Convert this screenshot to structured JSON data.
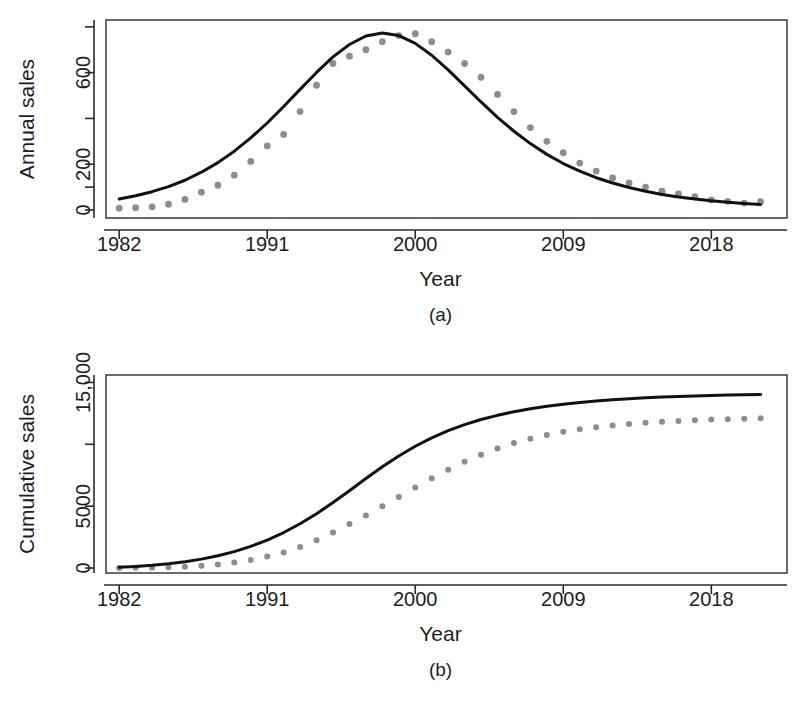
{
  "figure": {
    "background": "#ffffff",
    "ink_color": "#1a1a1a",
    "point_color": "#8d8d8d",
    "line_color": "#111111"
  },
  "panels": [
    {
      "tag": "(a)",
      "xlabel": "Year",
      "ylabel": "Annual sales",
      "x_ticks": [
        "1982",
        "1991",
        "2000",
        "2009",
        "2018"
      ],
      "y_ticks": [
        "0",
        "",
        "200",
        "",
        "600",
        ""
      ]
    },
    {
      "tag": "(b)",
      "xlabel": "Year",
      "ylabel": "Cumulative sales",
      "x_ticks": [
        "1982",
        "1991",
        "2000",
        "2009",
        "2018"
      ],
      "y_ticks": [
        "0",
        "5000",
        "",
        "15,000"
      ]
    }
  ],
  "chart_data": [
    {
      "id": "panel-a",
      "type": "scatter",
      "title": "",
      "subtitle": "(a)",
      "xlabel": "Year",
      "ylabel": "Annual sales",
      "xlim": [
        1981.2,
        2022.6
      ],
      "ylim": [
        -35,
        830
      ],
      "x_tick_values": [
        1982,
        1991,
        2000,
        2009,
        2018
      ],
      "x_tick_labels": [
        "1982",
        "1991",
        "2000",
        "2009",
        "2018"
      ],
      "y_tick_values": [
        0,
        100,
        200,
        400,
        600,
        800
      ],
      "y_tick_labels": [
        "0",
        "",
        "200",
        "",
        "600",
        ""
      ],
      "grid": false,
      "legend": "none",
      "x": [
        1982,
        1983,
        1984,
        1985,
        1986,
        1987,
        1988,
        1989,
        1990,
        1991,
        1992,
        1993,
        1994,
        1995,
        1996,
        1997,
        1998,
        1999,
        2000,
        2001,
        2002,
        2003,
        2004,
        2005,
        2006,
        2007,
        2008,
        2009,
        2010,
        2011,
        2012,
        2013,
        2014,
        2015,
        2016,
        2017,
        2018,
        2019,
        2020,
        2021
      ],
      "series": [
        {
          "name": "Observed annual sales",
          "marker": "filled-circle",
          "color": "#8d8d8d",
          "values": [
            8,
            10,
            14,
            25,
            46,
            78,
            108,
            152,
            212,
            280,
            330,
            430,
            545,
            640,
            672,
            700,
            735,
            762,
            770,
            735,
            690,
            640,
            580,
            505,
            430,
            360,
            300,
            250,
            205,
            170,
            140,
            118,
            100,
            82,
            70,
            58,
            44,
            38,
            30,
            36
          ]
        },
        {
          "name": "Fitted Bass model",
          "marker": "none",
          "line": "solid",
          "color": "#111111",
          "values": [
            48,
            62,
            80,
            102,
            130,
            165,
            207,
            257,
            315,
            380,
            452,
            527,
            601,
            669,
            723,
            760,
            773,
            762,
            728,
            676,
            612,
            542,
            472,
            405,
            344,
            290,
            243,
            203,
            170,
            141,
            118,
            98,
            82,
            68,
            57,
            48,
            40,
            34,
            28,
            24
          ]
        }
      ]
    },
    {
      "id": "panel-b",
      "type": "scatter",
      "title": "",
      "subtitle": "(b)",
      "xlabel": "Year",
      "ylabel": "Cumulative sales",
      "xlim": [
        1981.2,
        2022.6
      ],
      "ylim": [
        -400,
        15600
      ],
      "x_tick_values": [
        1982,
        1991,
        2000,
        2009,
        2018
      ],
      "x_tick_labels": [
        "1982",
        "1991",
        "2000",
        "2009",
        "2018"
      ],
      "y_tick_values": [
        0,
        5000,
        10000,
        15000
      ],
      "y_tick_labels": [
        "0",
        "5000",
        "",
        "15,000"
      ],
      "grid": false,
      "legend": "none",
      "x": [
        1982,
        1983,
        1984,
        1985,
        1986,
        1987,
        1988,
        1989,
        1990,
        1991,
        1992,
        1993,
        1994,
        1995,
        1996,
        1997,
        1998,
        1999,
        2000,
        2001,
        2002,
        2003,
        2004,
        2005,
        2006,
        2007,
        2008,
        2009,
        2010,
        2011,
        2012,
        2013,
        2014,
        2015,
        2016,
        2017,
        2018,
        2019,
        2020,
        2021
      ],
      "series": [
        {
          "name": "Observed cumulative sales",
          "marker": "filled-circle",
          "color": "#8d8d8d",
          "values": [
            8,
            18,
            32,
            57,
            103,
            181,
            289,
            441,
            653,
            933,
            1263,
            1693,
            2238,
            2878,
            3550,
            4250,
            4985,
            5747,
            6517,
            7252,
            7942,
            8582,
            9162,
            9667,
            10097,
            10457,
            10757,
            11007,
            11212,
            11382,
            11522,
            11640,
            11740,
            11822,
            11892,
            11950,
            11994,
            12032,
            12062,
            12098
          ]
        },
        {
          "name": "Fitted cumulative curve",
          "marker": "none",
          "line": "solid",
          "color": "#111111",
          "values": [
            60,
            130,
            225,
            350,
            510,
            720,
            990,
            1330,
            1750,
            2260,
            2870,
            3580,
            4390,
            5290,
            6250,
            7230,
            8180,
            9060,
            9840,
            10520,
            11100,
            11590,
            12000,
            12340,
            12630,
            12870,
            13070,
            13240,
            13380,
            13500,
            13600,
            13685,
            13755,
            13815,
            13865,
            13908,
            13945,
            13977,
            14004,
            14028
          ]
        }
      ]
    }
  ]
}
